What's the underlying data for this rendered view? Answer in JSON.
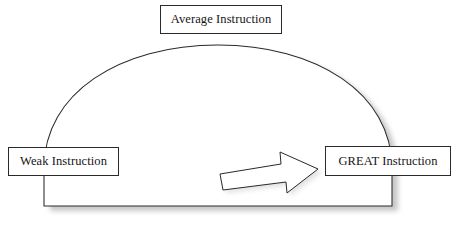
{
  "diagram": {
    "background_color": "#ffffff",
    "stroke_color": "#2a2a2a",
    "shadow_color": "#8a8a8a",
    "nodes": {
      "average": {
        "label": "Average Instruction",
        "position": "top-center"
      },
      "weak": {
        "label": "Weak Instruction",
        "position": "left"
      },
      "great": {
        "label": "GREAT Instruction",
        "position": "right"
      }
    },
    "shapes": {
      "dome": {
        "name": "semicircular-arc",
        "description": "Half-dome arc spanning from Weak Instruction on the left, over Average Instruction at the apex, down to GREAT Instruction on the right, closed by a flat baseline."
      },
      "arrow": {
        "name": "block-arrow",
        "direction": "right",
        "description": "Open outlined block arrow pointing from center toward GREAT Instruction."
      }
    }
  }
}
